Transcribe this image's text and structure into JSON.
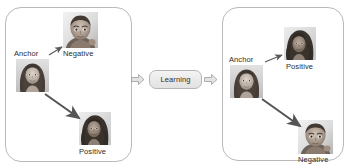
{
  "figure": {
    "background_color": "#ffffff",
    "panel_border_color": "#b9b9b9"
  },
  "before_panel": {
    "name": "before-learning-embedding-space",
    "anchor": {
      "label": "Anchor",
      "image": "face-woman-long-hair-thumbnail"
    },
    "negative": {
      "label": "Negative",
      "image": "face-baby-thumbnail"
    },
    "positive": {
      "label": "Positive",
      "image": "face-woman-dark-hair-thumbnail"
    },
    "arrows": [
      {
        "name": "anchor-to-negative-arrow",
        "from": "Anchor",
        "to": "Negative",
        "length": "short"
      },
      {
        "name": "anchor-to-positive-arrow",
        "from": "Anchor",
        "to": "Positive",
        "length": "long"
      }
    ]
  },
  "middle": {
    "learning_label": "Learning",
    "arrow_in": "block-arrow-right-icon",
    "arrow_out": "block-arrow-right-icon"
  },
  "after_panel": {
    "name": "after-learning-embedding-space",
    "anchor": {
      "label": "Anchor",
      "image": "face-woman-long-hair-thumbnail"
    },
    "positive": {
      "label": "Positive",
      "image": "face-woman-dark-hair-thumbnail"
    },
    "negative": {
      "label": "Negative",
      "image": "face-baby-thumbnail"
    },
    "arrows": [
      {
        "name": "anchor-to-positive-arrow",
        "from": "Anchor",
        "to": "Positive",
        "length": "short"
      },
      {
        "name": "anchor-to-negative-arrow",
        "from": "Anchor",
        "to": "Negative",
        "length": "long"
      }
    ]
  },
  "colors": {
    "arrow": "#5a5a5a",
    "text": "#2b2b2b",
    "box_fill": "#ececec"
  }
}
